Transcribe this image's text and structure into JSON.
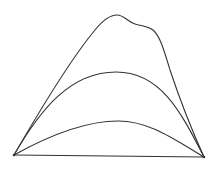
{
  "diagram": {
    "background": "#ffffff",
    "stroke_color": "#333333",
    "stroke_width": 1.1,
    "vertices": {
      "left": [
        14,
        155
      ],
      "right": [
        204,
        157
      ]
    },
    "curves": [
      {
        "name": "outer-curve",
        "d": "M14,155 C40,110 70,60 95,30 C103,20 110,15 117,15 C124,15 128,22 135,24 C142,26 148,26 153,30 C160,36 164,50 170,70 C180,100 194,135 204,157"
      },
      {
        "name": "middle-curve",
        "d": "M14,155 C40,110 70,72 116,72 C160,72 180,110 204,157"
      },
      {
        "name": "inner-curve",
        "d": "M14,155 C50,135 85,121 118,121 C150,121 175,140 204,157"
      },
      {
        "name": "baseline",
        "d": "M14,155 L204,157"
      }
    ]
  }
}
